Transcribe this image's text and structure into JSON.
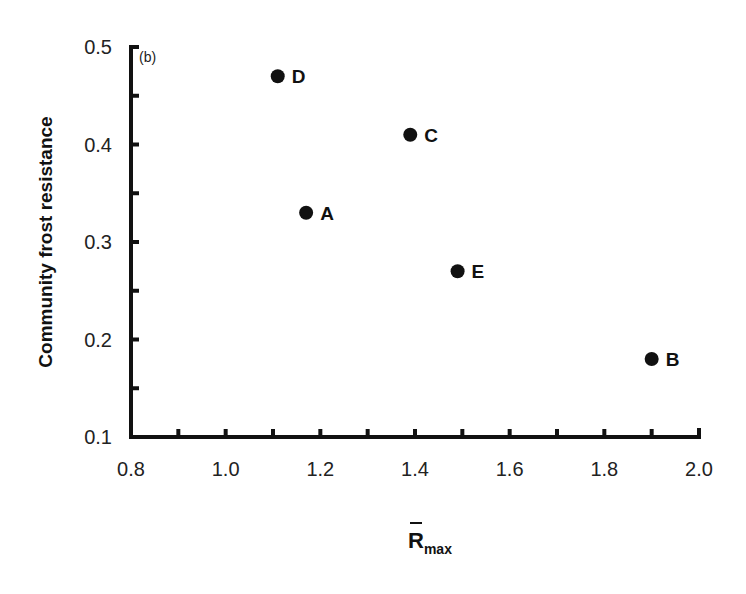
{
  "chart_data": {
    "type": "scatter",
    "title": "",
    "panel_label": "(b)",
    "xlabel": "R̄max",
    "xlabel_base": "R",
    "xlabel_sub": "max",
    "ylabel": "Community frost resistance",
    "xlim": [
      0.8,
      2.0
    ],
    "ylim": [
      0.1,
      0.5
    ],
    "x_ticks": [
      "0.8",
      "1.0",
      "1.2",
      "1.4",
      "1.6",
      "1.8",
      "2.0"
    ],
    "y_ticks": [
      "0.1",
      "0.2",
      "0.3",
      "0.4",
      "0.5"
    ],
    "grid": false,
    "legend": null,
    "points": [
      {
        "label": "A",
        "x": 1.17,
        "y": 0.33
      },
      {
        "label": "B",
        "x": 1.9,
        "y": 0.18
      },
      {
        "label": "C",
        "x": 1.39,
        "y": 0.41
      },
      {
        "label": "D",
        "x": 1.11,
        "y": 0.47
      },
      {
        "label": "E",
        "x": 1.49,
        "y": 0.27
      }
    ],
    "marker_color": "#111111"
  }
}
